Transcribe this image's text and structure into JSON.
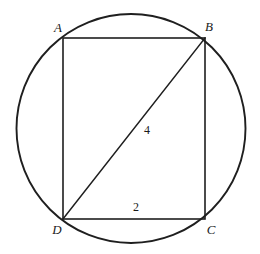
{
  "figure": {
    "canvas": {
      "width": 260,
      "height": 254,
      "background": "#ffffff"
    },
    "stroke_color": "#1f1f1f",
    "circle": {
      "name": "circumscribed-circle",
      "cx": 131,
      "cy": 128.5,
      "r": 114.5,
      "stroke_width": 1.9
    },
    "rectangle": {
      "name": "rectangle-abcd",
      "x": 63,
      "y": 38,
      "width": 142,
      "height": 181,
      "stroke_width": 1.6
    },
    "diagonal": {
      "name": "diagonal-db",
      "x1": 63,
      "y1": 219,
      "x2": 205,
      "y2": 38,
      "stroke_width": 1.6
    },
    "vertices": [
      {
        "id": "A",
        "label": "A",
        "x": 63,
        "y": 38,
        "label_x": 58,
        "label_y": 27
      },
      {
        "id": "B",
        "label": "B",
        "x": 205,
        "y": 38,
        "label_x": 209,
        "label_y": 26
      },
      {
        "id": "C",
        "label": "C",
        "x": 205,
        "y": 219,
        "label_x": 211,
        "label_y": 229
      },
      {
        "id": "D",
        "label": "D",
        "x": 63,
        "y": 219,
        "label_x": 57,
        "label_y": 229
      }
    ],
    "measurements": [
      {
        "id": "diagonal-length",
        "label": "4",
        "segment": "DB",
        "x": 147,
        "y": 130
      },
      {
        "id": "base-length",
        "label": "2",
        "segment": "DC",
        "x": 136,
        "y": 207
      }
    ]
  }
}
